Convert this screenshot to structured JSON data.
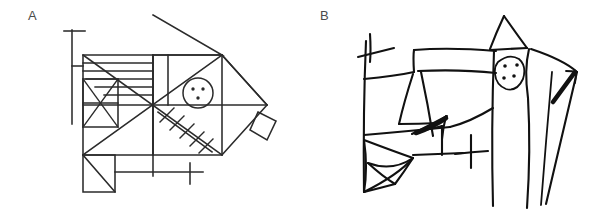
{
  "figure": {
    "background_color": "#ffffff",
    "ink_color_a": "#2b2b2b",
    "ink_color_b": "#111111",
    "label_color": "#4b4b4b",
    "width": 601,
    "height": 217
  },
  "panels": [
    {
      "id": "a",
      "label": "A",
      "label_x": 28,
      "label_y": 9,
      "description": "Rey-Osterrieth Complex Figure - accurate model copy, ruled straight lines",
      "elements": [
        {
          "name": "outer-large-rectangle",
          "kind": "rectangle"
        },
        {
          "name": "horizontal-midline",
          "kind": "line"
        },
        {
          "name": "vertical-midline",
          "kind": "line"
        },
        {
          "name": "main-diagonal-up",
          "kind": "line"
        },
        {
          "name": "main-diagonal-down",
          "kind": "line"
        },
        {
          "name": "small-square-upper-left",
          "kind": "rectangle"
        },
        {
          "name": "small-square-cross",
          "kind": "x-cross"
        },
        {
          "name": "parallel-lines-upper-left",
          "kind": "four-horizontal-lines",
          "count": 4
        },
        {
          "name": "top-triangle",
          "kind": "triangle"
        },
        {
          "name": "right-triangle",
          "kind": "triangle"
        },
        {
          "name": "right-diamond",
          "kind": "diamond"
        },
        {
          "name": "circle-with-three-dots",
          "kind": "circle",
          "dots": 3
        },
        {
          "name": "hatched-diagonal",
          "kind": "diagonal-with-crosshatch",
          "hatch_count": 5
        },
        {
          "name": "bottom-left-square-diagonal",
          "kind": "square-with-diagonal"
        },
        {
          "name": "bottom-horizontal-bar",
          "kind": "line"
        },
        {
          "name": "bottom-cross",
          "kind": "small-cross"
        },
        {
          "name": "left-vertical-line",
          "kind": "line"
        },
        {
          "name": "left-cross",
          "kind": "small-cross"
        }
      ]
    },
    {
      "id": "b",
      "label": "B",
      "label_x": 20,
      "label_y": 9,
      "description": "Rey-Osterrieth Complex Figure - distorted freehand reproduction, fragmented and wavering lines",
      "elements": [
        {
          "name": "left-vertical-stroke",
          "kind": "line"
        },
        {
          "name": "left-cross",
          "kind": "small-cross"
        },
        {
          "name": "upper-slanted-band",
          "kind": "quadrilateral"
        },
        {
          "name": "middle-slanted-band",
          "kind": "quadrilateral"
        },
        {
          "name": "inner-triangle",
          "kind": "triangle"
        },
        {
          "name": "fan-triangle-cluster",
          "kind": "triangle-fan"
        },
        {
          "name": "scribbled-arrow-cluster",
          "kind": "overlapping-strokes"
        },
        {
          "name": "lower-cross",
          "kind": "small-cross"
        },
        {
          "name": "roof-peak-triangle",
          "kind": "triangle"
        },
        {
          "name": "blob-with-four-dots",
          "kind": "blob",
          "dots": 4
        },
        {
          "name": "long-vertical-stroke-1",
          "kind": "line"
        },
        {
          "name": "long-vertical-stroke-2",
          "kind": "line"
        },
        {
          "name": "long-vertical-stroke-3",
          "kind": "line"
        },
        {
          "name": "right-wedge-outline",
          "kind": "wedge"
        },
        {
          "name": "thick-arrow-stroke",
          "kind": "arrow"
        }
      ]
    }
  ]
}
